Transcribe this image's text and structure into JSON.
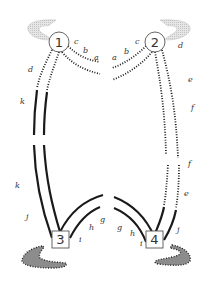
{
  "diagram": {
    "nodes": [
      {
        "id": "1",
        "label": "1",
        "shape": "circle"
      },
      {
        "id": "2",
        "label": "2",
        "shape": "circle"
      },
      {
        "id": "3",
        "label": "3",
        "shape": "square"
      },
      {
        "id": "4",
        "label": "4",
        "shape": "square"
      }
    ],
    "segment_labels": {
      "left": {
        "c": "c",
        "b": "b",
        "a": "a",
        "d": "d",
        "k_upper": "k",
        "k_lower": "k",
        "j": "j",
        "i": "i",
        "h": "h",
        "g": "g"
      },
      "right": {
        "a": "a",
        "b": "b",
        "c": "c",
        "d": "d",
        "e_upper": "e",
        "f_upper": "f",
        "f_lower": "f",
        "e_lower": "e",
        "j": "j",
        "i": "i",
        "h": "h",
        "g": "g"
      }
    },
    "colors": {
      "line": "#1a1a1a",
      "node_stroke": "#555555",
      "wisp_fill": "#d8d8d8",
      "blob_fill": "#8c8c8c"
    }
  }
}
